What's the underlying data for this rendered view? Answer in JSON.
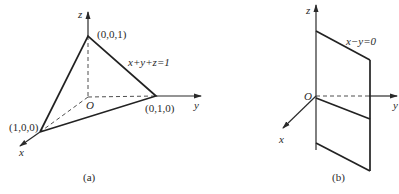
{
  "figure_a": {
    "caption": "(a)",
    "axes": {
      "x": "x",
      "y": "y",
      "z": "z",
      "origin": "O"
    },
    "vertices": {
      "x_intercept": "(1,0,0)",
      "y_intercept": "(0,1,0)",
      "z_intercept": "(0,0,1)"
    },
    "plane_equation": "x+y+z=1"
  },
  "figure_b": {
    "caption": "(b)",
    "axes": {
      "x": "x",
      "y": "y",
      "z": "z",
      "origin": "O"
    },
    "plane_equation": "x−y=0"
  },
  "colors": {
    "ink": "#2a2a2a",
    "background": "#ffffff"
  }
}
